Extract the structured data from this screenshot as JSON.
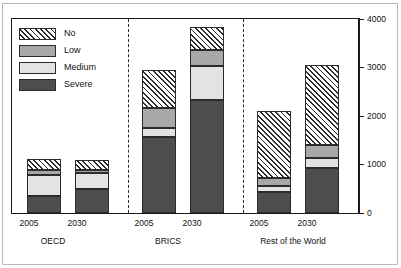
{
  "chart_data": {
    "type": "bar",
    "stacked": true,
    "title": "",
    "xlabel": "",
    "ylabel": "",
    "ylim": [
      0,
      4000
    ],
    "yticks": [
      "0",
      "1000",
      "2000",
      "3000",
      "4000"
    ],
    "grid": false,
    "legend_position": "top-left",
    "legend": [
      "No",
      "Low",
      "Medium",
      "Severe"
    ],
    "groups": [
      {
        "name": "OECD",
        "categories": [
          "2005",
          "2030"
        ]
      },
      {
        "name": "BRICS",
        "categories": [
          "2005",
          "2030"
        ]
      },
      {
        "name": "Rest of the World",
        "categories": [
          "2005",
          "2030"
        ]
      }
    ],
    "categories": [
      "2005",
      "2030",
      "2005",
      "2030",
      "2005",
      "2030"
    ],
    "series": [
      {
        "name": "Severe",
        "values": [
          350,
          490,
          1570,
          2330,
          430,
          930
        ]
      },
      {
        "name": "Medium",
        "values": [
          430,
          330,
          185,
          700,
          125,
          205
        ]
      },
      {
        "name": "Low",
        "values": [
          100,
          60,
          410,
          330,
          165,
          270
        ]
      },
      {
        "name": "No",
        "values": [
          230,
          210,
          785,
          470,
          1380,
          1650
        ]
      }
    ],
    "totals": [
      1110,
      1090,
      2950,
      3830,
      2100,
      3050
    ],
    "colors": {
      "severe": "#4d4d4d",
      "medium": "#e3e3e3",
      "low": "#a8a8a8",
      "no": "#ffffff",
      "axis": "#1a1a1a",
      "outline": "#2b2b2b"
    }
  },
  "axis": {
    "y_labels": [
      "4000",
      "3000",
      "2000",
      "1000",
      "0"
    ]
  },
  "xaxis": {
    "ticks": [
      "2005",
      "2030",
      "2005",
      "2030",
      "2005",
      "2030"
    ],
    "groups": [
      "OECD",
      "BRICS",
      "Rest of the World"
    ]
  },
  "legend": {
    "items": [
      {
        "label": "No",
        "pattern": "hatched"
      },
      {
        "label": "Low",
        "pattern": "solid-gray"
      },
      {
        "label": "Medium",
        "pattern": "solid-light"
      },
      {
        "label": "Severe",
        "pattern": "solid-dark"
      }
    ]
  }
}
